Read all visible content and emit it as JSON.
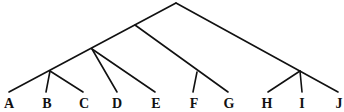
{
  "diagram": {
    "type": "tree",
    "leaves": [
      {
        "label": "A",
        "x": 9
      },
      {
        "label": "B",
        "x": 47
      },
      {
        "label": "C",
        "x": 84
      },
      {
        "label": "D",
        "x": 117
      },
      {
        "label": "E",
        "x": 156
      },
      {
        "label": "F",
        "x": 194
      },
      {
        "label": "G",
        "x": 229
      },
      {
        "label": "H",
        "x": 267
      },
      {
        "label": "I",
        "x": 302
      },
      {
        "label": "J",
        "x": 340
      }
    ],
    "clades": [
      {
        "name": "root",
        "members": [
          "A",
          "B",
          "C",
          "D",
          "E",
          "F",
          "G",
          "H",
          "I",
          "J"
        ]
      },
      {
        "name": "A-G",
        "members": [
          "A",
          "B",
          "C",
          "D",
          "E",
          "F",
          "G"
        ]
      },
      {
        "name": "A-E",
        "members": [
          "A",
          "B",
          "C",
          "D",
          "E"
        ]
      },
      {
        "name": "ABC",
        "members": [
          "A",
          "B",
          "C"
        ]
      },
      {
        "name": "FG",
        "members": [
          "F",
          "G"
        ]
      },
      {
        "name": "HIJ",
        "members": [
          "H",
          "I",
          "J"
        ]
      }
    ],
    "style": {
      "line_color": "#111111",
      "label_color": "#111111",
      "background": "#ffffff"
    }
  }
}
